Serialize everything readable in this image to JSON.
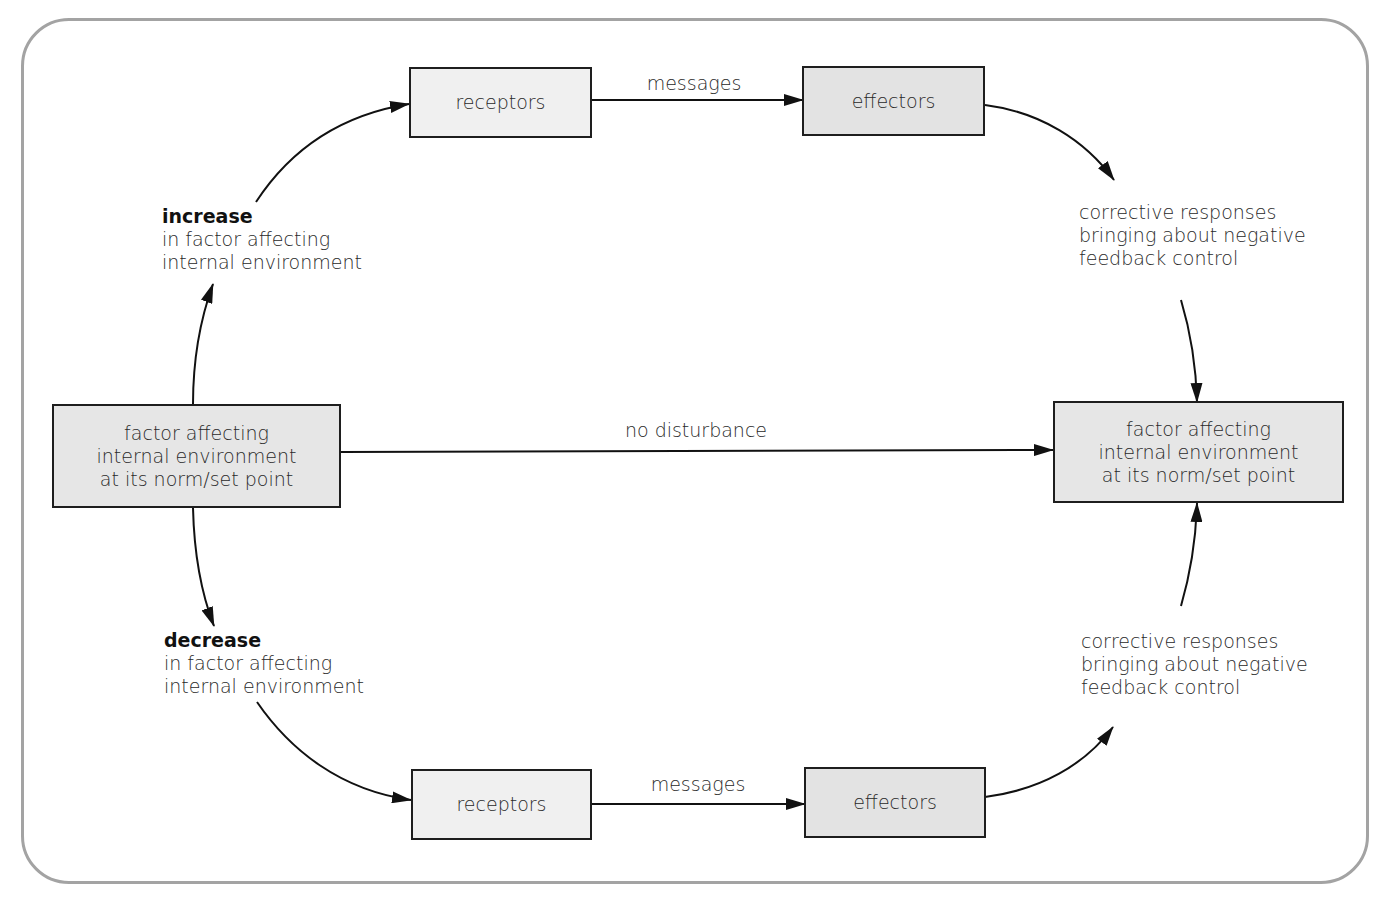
{
  "diagram": {
    "colors": {
      "frame": "#a3a3a3",
      "receptor_fill": "#f0f0f0",
      "effector_fill": "#e3e3e3",
      "state_fill": "#e6e6e6",
      "stroke": "#1e1e1e"
    },
    "left_state": {
      "lines": [
        "factor affecting",
        "internal environment",
        "at its norm/set point"
      ]
    },
    "right_state": {
      "lines": [
        "factor affecting",
        "internal environment",
        "at its norm/set point"
      ]
    },
    "no_disturbance_label": "no disturbance",
    "top_branch": {
      "trigger": {
        "bold": "increase",
        "lines": [
          "in factor affecting",
          "internal environment"
        ]
      },
      "receptors_label": "receptors",
      "messages_label": "messages",
      "effectors_label": "effectors",
      "response": {
        "lines": [
          "corrective responses",
          "bringing about negative",
          "feedback control"
        ]
      }
    },
    "bottom_branch": {
      "trigger": {
        "bold": "decrease",
        "lines": [
          "in factor affecting",
          "internal environment"
        ]
      },
      "receptors_label": "receptors",
      "messages_label": "messages",
      "effectors_label": "effectors",
      "response": {
        "lines": [
          "corrective responses",
          "bringing about negative",
          "feedback control"
        ]
      }
    }
  }
}
